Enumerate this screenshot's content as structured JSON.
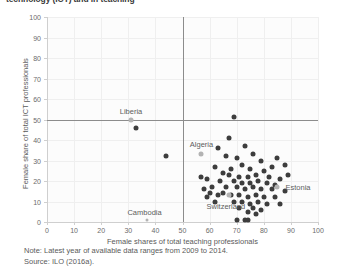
{
  "title": "technology (ICT) and in teaching",
  "footnote": {
    "note": "Note: Latest year of available data ranges from 2009 to 2014.",
    "source": "Source: ILO (2016a)."
  },
  "colors": {
    "point_dark": "#3d3d3d",
    "point_light": "#b3b3b3",
    "reference_line": "#8c8c8c",
    "gridline": "#efefef",
    "axis": "#cfcfcf",
    "text": "#5a5a5a"
  },
  "chart_data": {
    "type": "scatter",
    "title": "technology (ICT) and in teaching",
    "xlabel": "Female shares of total teaching professionals",
    "ylabel": "Female share of total ICT professionals",
    "xlim": [
      0,
      100
    ],
    "ylim": [
      0,
      100
    ],
    "xticks": [
      0,
      10,
      20,
      30,
      40,
      50,
      60,
      70,
      80,
      90,
      100
    ],
    "yticks": [
      0,
      10,
      20,
      30,
      40,
      50,
      60,
      70,
      80,
      90,
      100
    ],
    "grid": true,
    "legend": "none",
    "reference_lines": [
      {
        "axis": "y",
        "value": 50
      },
      {
        "axis": "x",
        "value": 50
      }
    ],
    "annotations": [
      {
        "label": "Liberia",
        "x": 31,
        "y": 54,
        "anchor": "center"
      },
      {
        "label": "Algeria",
        "x": 57,
        "y": 38,
        "anchor": "center"
      },
      {
        "label": "Cambodia",
        "x": 36,
        "y": 5,
        "anchor": "center"
      },
      {
        "label": "Switzerland",
        "x": 66,
        "y": 8,
        "anchor": "center"
      },
      {
        "label": "Estonia",
        "x": 88,
        "y": 17,
        "anchor": "left"
      }
    ],
    "highlighted_points": [
      {
        "label": "Liberia",
        "x": 31,
        "y": 50
      },
      {
        "label": "Algeria",
        "x": 57,
        "y": 33
      },
      {
        "label": "Cambodia",
        "x": 37,
        "y": 1
      },
      {
        "label": "Switzerland",
        "x": 67,
        "y": 13
      },
      {
        "label": "Estonia",
        "x": 85,
        "y": 17
      }
    ],
    "points": [
      {
        "x": 33,
        "y": 46
      },
      {
        "x": 44,
        "y": 32
      },
      {
        "x": 69,
        "y": 51
      },
      {
        "x": 63,
        "y": 36
      },
      {
        "x": 73,
        "y": 37
      },
      {
        "x": 66,
        "y": 32
      },
      {
        "x": 70,
        "y": 31
      },
      {
        "x": 76,
        "y": 33
      },
      {
        "x": 79,
        "y": 30
      },
      {
        "x": 62,
        "y": 27
      },
      {
        "x": 72,
        "y": 28
      },
      {
        "x": 83,
        "y": 27
      },
      {
        "x": 88,
        "y": 28
      },
      {
        "x": 68,
        "y": 26
      },
      {
        "x": 75,
        "y": 26
      },
      {
        "x": 80,
        "y": 25
      },
      {
        "x": 57,
        "y": 22
      },
      {
        "x": 59,
        "y": 21
      },
      {
        "x": 65,
        "y": 24
      },
      {
        "x": 67,
        "y": 23
      },
      {
        "x": 71,
        "y": 22
      },
      {
        "x": 74,
        "y": 22
      },
      {
        "x": 77,
        "y": 23
      },
      {
        "x": 82,
        "y": 22
      },
      {
        "x": 86,
        "y": 21
      },
      {
        "x": 64,
        "y": 20
      },
      {
        "x": 69,
        "y": 20
      },
      {
        "x": 72,
        "y": 19
      },
      {
        "x": 75,
        "y": 19
      },
      {
        "x": 78,
        "y": 20
      },
      {
        "x": 81,
        "y": 19
      },
      {
        "x": 84,
        "y": 18
      },
      {
        "x": 61,
        "y": 17
      },
      {
        "x": 66,
        "y": 17
      },
      {
        "x": 70,
        "y": 17
      },
      {
        "x": 73,
        "y": 16
      },
      {
        "x": 76,
        "y": 17
      },
      {
        "x": 79,
        "y": 16
      },
      {
        "x": 83,
        "y": 16
      },
      {
        "x": 88,
        "y": 15
      },
      {
        "x": 60,
        "y": 14
      },
      {
        "x": 63,
        "y": 13
      },
      {
        "x": 65,
        "y": 14
      },
      {
        "x": 68,
        "y": 13
      },
      {
        "x": 71,
        "y": 13
      },
      {
        "x": 74,
        "y": 12
      },
      {
        "x": 77,
        "y": 13
      },
      {
        "x": 80,
        "y": 12
      },
      {
        "x": 84,
        "y": 12
      },
      {
        "x": 62,
        "y": 10
      },
      {
        "x": 69,
        "y": 10
      },
      {
        "x": 72,
        "y": 10
      },
      {
        "x": 75,
        "y": 9
      },
      {
        "x": 78,
        "y": 10
      },
      {
        "x": 81,
        "y": 9
      },
      {
        "x": 86,
        "y": 9
      },
      {
        "x": 71,
        "y": 7
      },
      {
        "x": 76,
        "y": 7
      },
      {
        "x": 79,
        "y": 6
      },
      {
        "x": 74,
        "y": 5
      },
      {
        "x": 77,
        "y": 4
      },
      {
        "x": 70,
        "y": 1
      },
      {
        "x": 73,
        "y": 1
      },
      {
        "x": 74,
        "y": 1
      },
      {
        "x": 89,
        "y": 23
      },
      {
        "x": 85,
        "y": 31
      },
      {
        "x": 67,
        "y": 41
      },
      {
        "x": 58,
        "y": 16
      },
      {
        "x": 59,
        "y": 12
      }
    ]
  }
}
